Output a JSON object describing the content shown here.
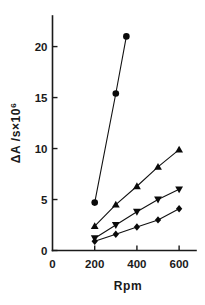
{
  "chart_data": {
    "type": "line",
    "title": "",
    "subtitle": "",
    "xlabel": "Rpm",
    "ylabel": "ΔA /s×10",
    "ylabel_exponent": "6",
    "xlim": [
      0,
      680
    ],
    "ylim": [
      0,
      23
    ],
    "grid": false,
    "legend": "none",
    "xticks": [
      0,
      200,
      400,
      600
    ],
    "xtick_labels": [
      "0",
      "200",
      "400",
      "600"
    ],
    "yticks": [
      0,
      5,
      10,
      15,
      20
    ],
    "ytick_labels": [
      "0",
      "5",
      "10",
      "15",
      "20"
    ],
    "series": [
      {
        "name": "series-circle",
        "marker": "circle",
        "color": "#0a0a0a",
        "x": [
          200,
          300,
          350
        ],
        "values": [
          4.7,
          15.4,
          21.0
        ]
      },
      {
        "name": "series-triangle-up",
        "marker": "triangle-up",
        "color": "#0a0a0a",
        "x": [
          200,
          300,
          400,
          500,
          600
        ],
        "values": [
          2.4,
          4.5,
          6.3,
          8.2,
          9.9
        ]
      },
      {
        "name": "series-triangle-down",
        "marker": "triangle-down",
        "color": "#0a0a0a",
        "x": [
          200,
          300,
          400,
          500,
          600
        ],
        "values": [
          1.2,
          2.5,
          3.8,
          5.0,
          6.0
        ]
      },
      {
        "name": "series-diamond",
        "marker": "diamond",
        "color": "#0a0a0a",
        "x": [
          200,
          300,
          400,
          500,
          600
        ],
        "values": [
          0.9,
          1.6,
          2.3,
          3.0,
          4.1
        ]
      }
    ]
  }
}
